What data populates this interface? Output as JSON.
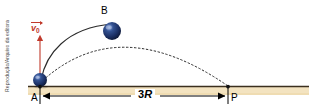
{
  "figure": {
    "credit": "Reprodução/Arquivo da editora",
    "background_color": "#ffffff"
  },
  "ground": {
    "strip_color": "#f3e3c0",
    "line_color": "#3b2f1e",
    "left_x": 28,
    "right_x": 309,
    "y": 86
  },
  "points": [
    {
      "id": "A",
      "label": "A",
      "x": 40,
      "y": 86
    },
    {
      "id": "B",
      "label": "B",
      "x": 110,
      "y": 30
    },
    {
      "id": "P",
      "label": "P",
      "x": 228,
      "y": 86
    }
  ],
  "balls": [
    {
      "at": "A",
      "cx": 40,
      "cy": 80,
      "r": 7,
      "color": "#1b2f63",
      "highlight": "#5f7fc4"
    },
    {
      "at": "B",
      "cx": 112,
      "cy": 31,
      "r": 9,
      "color": "#1b2f63",
      "highlight": "#5f7fc4"
    }
  ],
  "vector": {
    "name": "v0",
    "symbol": "v",
    "subscript": "0",
    "color": "#c0392b",
    "tail_x": 40,
    "tail_y": 84,
    "head_x": 40,
    "head_y": 36,
    "has_overarrow": true
  },
  "curves": [
    {
      "name": "solid-trajectory",
      "style": "solid",
      "color": "#2b2b2b",
      "description": "solid arc from A rising to B"
    },
    {
      "name": "dashed-trajectory",
      "style": "dashed",
      "color": "#2b2b2b",
      "description": "dashed parabolic path from A through B down to P"
    }
  ],
  "dimension": {
    "label_prefix": "3",
    "label_var": "R",
    "label": "3R",
    "from": "A",
    "to": "P",
    "y": 96,
    "arrow_color": "#000000"
  },
  "labels": {
    "B": "B",
    "A": "A",
    "P": "P"
  }
}
